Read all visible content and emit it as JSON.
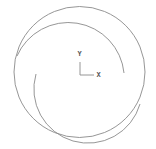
{
  "drawing": {
    "background": "#ffffff",
    "stroke_color": "#8a8a8a",
    "outer_circle": {
      "cx": 79.5,
      "cy": 72,
      "r": 65.5
    },
    "upper_arc": {
      "start": [
        17,
        56
      ],
      "end": [
        124,
        73
      ],
      "r": 56
    },
    "lower_arc": {
      "start": [
        36,
        74
      ],
      "end": [
        140,
        104
      ],
      "r": 53
    }
  },
  "ucs_icon": {
    "y_label": "Y",
    "x_label": "X"
  }
}
